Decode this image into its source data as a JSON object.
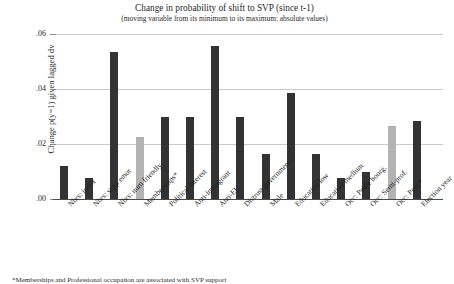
{
  "chart_data": {
    "type": "bar",
    "title": "Change in probability of shift to SVP (since t-1)",
    "subtitle": "(moving variable from its minimum to its maximum: absolute values)",
    "xlabel": "",
    "ylabel": "Change p(y=1) given lagged dv",
    "ylim": [
      0,
      0.06
    ],
    "yticks": [
      ".00",
      ".02",
      ".04",
      ".06"
    ],
    "ytick_values": [
      0.0,
      0.02,
      0.04,
      0.06
    ],
    "grid": true,
    "legend": "none",
    "categories": [
      "Nbrs: index",
      "Nbrs: supp emot",
      "Nbrs: num friendly",
      "Memberships*",
      "Political interest",
      "Anti-immigrant",
      "Anti-EU",
      "Distrust government",
      "Male",
      "Education low",
      "Education medium",
      "Occ: Petite bourg.",
      "Occ: Semi-prof.",
      "Occ: Prof.*",
      "Election year"
    ],
    "values": [
      0.012,
      0.0075,
      0.0535,
      0.0225,
      0.03,
      0.03,
      0.0555,
      0.03,
      0.0165,
      0.0385,
      0.0165,
      0.0075,
      0.0098,
      0.0265,
      0.0285
    ],
    "bar_colors": [
      "dark",
      "dark",
      "dark",
      "light",
      "dark",
      "dark",
      "dark",
      "dark",
      "dark",
      "dark",
      "dark",
      "dark",
      "dark",
      "light",
      "dark"
    ],
    "colors": {
      "dark": "#333333",
      "light": "#b3b3b3",
      "grid": "#c9c9c9",
      "axis": "#4a4a4a"
    }
  },
  "footnote": "*Memberships and Professional occupation are associated with SVP support"
}
